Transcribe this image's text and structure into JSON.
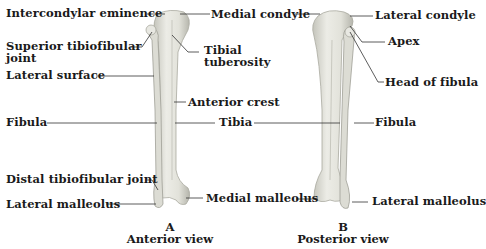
{
  "figure": {
    "view_a": {
      "letter": "A",
      "title": "Anterior view",
      "labels": {
        "intercondylar_eminence": "Intercondylar eminence",
        "medial_condyle": "Medial condyle",
        "superior_tibiofibular_joint_1": "Superior tibiofibular",
        "superior_tibiofibular_joint_2": "joint",
        "tibial_tuberosity_1": "Tibial",
        "tibial_tuberosity_2": "tuberosity",
        "lateral_surface": "Lateral surface",
        "anterior_crest": "Anterior crest",
        "fibula": "Fibula",
        "tibia": "Tibia",
        "distal_tibiofibular_joint": "Distal tibiofibular joint",
        "lateral_malleolus": "Lateral malleolus",
        "medial_malleolus": "Medial malleolus"
      }
    },
    "view_b": {
      "letter": "B",
      "title": "Posterior view",
      "labels": {
        "lateral_condyle": "Lateral condyle",
        "apex": "Apex",
        "head_of_fibula": "Head of fibula",
        "fibula": "Fibula",
        "lateral_malleolus": "Lateral malleolus"
      }
    },
    "colors": {
      "bone_fill": "#e6e6df",
      "bone_shade": "#b9b9b0",
      "leader_line": "#333333"
    }
  }
}
